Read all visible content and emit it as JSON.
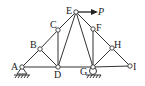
{
  "diagram": {
    "type": "truss",
    "nodes": [
      {
        "id": "A",
        "label": "A",
        "x": 22,
        "y": 67
      },
      {
        "id": "B",
        "label": "B",
        "x": 40,
        "y": 49
      },
      {
        "id": "C",
        "label": "C",
        "x": 58,
        "y": 30
      },
      {
        "id": "D",
        "label": "D",
        "x": 58,
        "y": 67
      },
      {
        "id": "E",
        "label": "E",
        "x": 76,
        "y": 12
      },
      {
        "id": "F",
        "label": "F",
        "x": 93,
        "y": 29
      },
      {
        "id": "G",
        "label": "G",
        "x": 93,
        "y": 67
      },
      {
        "id": "H",
        "label": "H",
        "x": 112,
        "y": 48
      },
      {
        "id": "I",
        "label": "I",
        "x": 130,
        "y": 66
      }
    ],
    "members": [
      [
        "A",
        "B"
      ],
      [
        "B",
        "C"
      ],
      [
        "C",
        "E"
      ],
      [
        "E",
        "F"
      ],
      [
        "F",
        "H"
      ],
      [
        "H",
        "I"
      ],
      [
        "A",
        "D"
      ],
      [
        "D",
        "G"
      ],
      [
        "G",
        "I"
      ],
      [
        "B",
        "D"
      ],
      [
        "C",
        "D"
      ],
      [
        "D",
        "E"
      ],
      [
        "E",
        "G"
      ],
      [
        "F",
        "G"
      ],
      [
        "G",
        "H"
      ]
    ],
    "supports": [
      {
        "node": "A",
        "type": "pin"
      },
      {
        "node": "G",
        "type": "roller"
      }
    ],
    "load": {
      "node": "E",
      "label": "P",
      "direction": "right"
    }
  }
}
